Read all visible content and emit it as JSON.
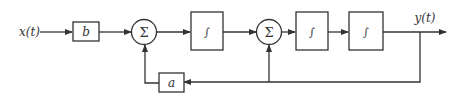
{
  "diagram": {
    "input_label": "x(t)",
    "output_label": "y(t)",
    "gain_b": "b",
    "gain_a": "a",
    "summer1": "Σ",
    "summer2": "Σ",
    "integrator1": "∫",
    "integrator2": "∫",
    "integrator3": "∫"
  },
  "colors": {
    "stroke": "#333333",
    "background": "#ffffff"
  }
}
